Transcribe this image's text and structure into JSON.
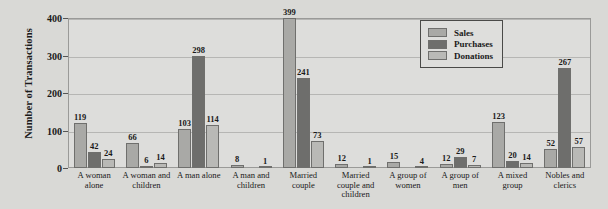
{
  "chart_data": {
    "type": "bar",
    "title": "",
    "xlabel": "",
    "ylabel": "Number of Transactions",
    "ylim": [
      0,
      400
    ],
    "yticks": [
      0,
      100,
      200,
      300,
      400
    ],
    "grid": true,
    "legend_position": "top-right",
    "categories": [
      "A woman alone",
      "A woman and children",
      "A man alone",
      "A man and children",
      "Married couple",
      "Married couple and children",
      "A group of women",
      "A group of men",
      "A mixed group",
      "Nobles and clerics"
    ],
    "series": [
      {
        "name": "Sales",
        "color": "#a9a9a6",
        "values": [
          119,
          66,
          103,
          8,
          399,
          12,
          15,
          12,
          123,
          52
        ]
      },
      {
        "name": "Purchases",
        "color": "#6e6e6c",
        "values": [
          42,
          6,
          298,
          0,
          241,
          0,
          0,
          29,
          20,
          267
        ]
      },
      {
        "name": "Donations",
        "color": "#b9b9b6",
        "values": [
          24,
          14,
          114,
          1,
          73,
          1,
          4,
          7,
          14,
          57
        ]
      }
    ]
  },
  "legend": {
    "items": [
      {
        "label": "Sales"
      },
      {
        "label": "Purchases"
      },
      {
        "label": "Donations"
      }
    ]
  },
  "colors": {
    "background": "#d9d9d6",
    "plot_background": "#dddddb",
    "gridline": "#b6b6b4",
    "axis": "#9a9a98",
    "text": "#1a1a1a"
  }
}
